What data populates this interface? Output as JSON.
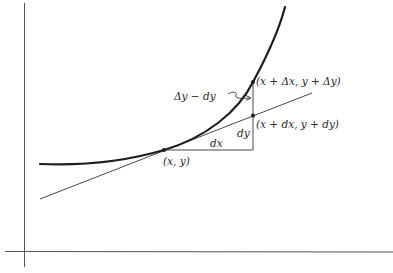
{
  "diagram": {
    "colors": {
      "background": "#ffffff",
      "curve": "#1e1e1e",
      "lines": "#333333",
      "axes": "#555555",
      "text": "#2a2a2a"
    },
    "labels": {
      "point_xy": "(x, y)",
      "point_delta": "(x + Δx, y + Δy)",
      "point_d": "(x + dx, y + dy)",
      "dx": "dx",
      "dy": "dy",
      "difference": "Δy − dy"
    },
    "points": {
      "xy": [
        164,
        150
      ],
      "delta": [
        253,
        82
      ],
      "d": [
        253,
        115
      ]
    },
    "elements": [
      "x-axis",
      "y-axis",
      "curve",
      "tangent-line",
      "dx-segment",
      "vertical-segment",
      "curved-arrow"
    ]
  }
}
